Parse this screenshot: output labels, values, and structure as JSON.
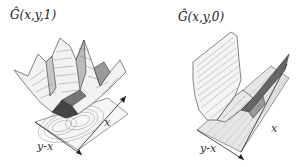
{
  "figure": {
    "panels": [
      {
        "id": "left",
        "title": "Ĝ(x,y,1)",
        "axis_labels": {
          "x": "x",
          "diagonal": "y-x"
        },
        "description": "3D surface with multiple sharp peaks over a wedge-shaped valley; contour projection (double-lobed) on base plane"
      },
      {
        "id": "right",
        "title": "Ĝ(x,y,0)",
        "axis_labels": {
          "x": "x",
          "diagonal": "y-x"
        },
        "description": "3D surface forming a long trough/valley along x with a ridge; striped contour projection on base plane"
      }
    ]
  },
  "colors": {
    "line": "#333333",
    "surface_light": "#f4f4f4",
    "surface_dark": "#555555",
    "contour": "#888888"
  }
}
